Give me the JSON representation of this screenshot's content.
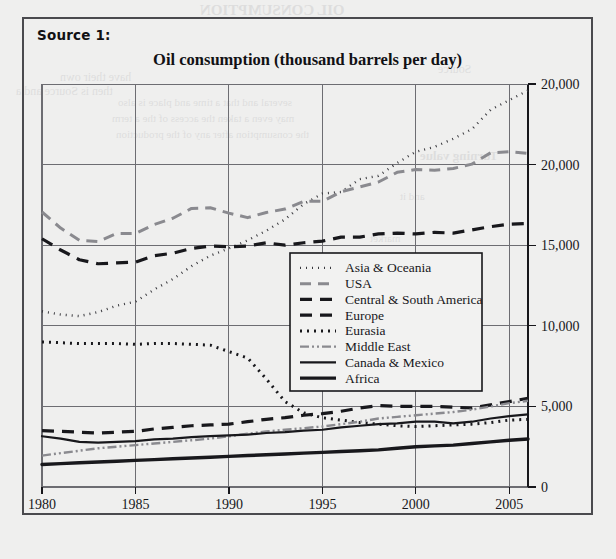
{
  "page": {
    "background_color": "#efefee",
    "frame_color": "#4a4a4e",
    "source_label": "Source 1:"
  },
  "bleed_text": [
    {
      "text": "OIL CONSUMPTION",
      "x": 200,
      "y": 2,
      "size": 15,
      "weight": "bold"
    },
    {
      "text": "have their own",
      "x": 60,
      "y": 70,
      "size": 12,
      "weight": "normal"
    },
    {
      "text": "several and that a time and place is also",
      "x": 118,
      "y": 96,
      "size": 11,
      "weight": "normal"
    },
    {
      "text": "may even a taken the access of the a term",
      "x": 112,
      "y": 112,
      "size": 11,
      "weight": "normal"
    },
    {
      "text": "the consumption after any of the production",
      "x": 116,
      "y": 128,
      "size": 11,
      "weight": "normal"
    },
    {
      "text": "Source",
      "x": 438,
      "y": 62,
      "size": 12,
      "weight": "normal"
    },
    {
      "text": "then is Source and a",
      "x": 16,
      "y": 84,
      "size": 12,
      "weight": "normal"
    },
    {
      "text": "Turning value",
      "x": 420,
      "y": 148,
      "size": 13,
      "weight": "bold"
    },
    {
      "text": "and it",
      "x": 400,
      "y": 190,
      "size": 11,
      "weight": "normal"
    },
    {
      "text": "market",
      "x": 370,
      "y": 232,
      "size": 11,
      "weight": "normal"
    }
  ],
  "chart_data": {
    "type": "line",
    "title": "Oil consumption (thousand barrels per day)",
    "xlabel": "",
    "ylabel": "",
    "grid": true,
    "legend_position": "center",
    "x": [
      1980,
      1981,
      1982,
      1983,
      1984,
      1985,
      1986,
      1987,
      1988,
      1989,
      1990,
      1991,
      1992,
      1993,
      1994,
      1995,
      1996,
      1997,
      1998,
      1999,
      2000,
      2001,
      2002,
      2003,
      2004,
      2005,
      2006
    ],
    "xlim": [
      1980,
      2006
    ],
    "ylim": [
      0,
      25000
    ],
    "xticks": [
      1980,
      1985,
      1990,
      1995,
      2000,
      2005
    ],
    "xtick_labels": [
      "1980",
      "1985",
      "1990",
      "1995",
      "2000",
      "2005"
    ],
    "yticks": [
      0,
      5000,
      10000,
      15000,
      20000,
      25000
    ],
    "ytick_labels": [
      "0",
      "5,000",
      "10,000",
      "15,000",
      "20,000",
      "20,000"
    ],
    "series": [
      {
        "name": "Asia & Oceania",
        "style": "dotted-fine",
        "color": "#3a3a3f",
        "width": 2.4,
        "dash": "1,5",
        "values": [
          10900,
          10700,
          10600,
          10850,
          11250,
          11500,
          12250,
          12900,
          13700,
          14350,
          14800,
          15300,
          15900,
          16600,
          17550,
          18200,
          18300,
          19100,
          19300,
          20100,
          20800,
          21100,
          21600,
          22200,
          23400,
          24000,
          24600
        ]
      },
      {
        "name": "USA",
        "style": "dashed-gray",
        "color": "#8a8a8f",
        "width": 3.0,
        "dash": "11,7",
        "values": [
          17060,
          16060,
          15300,
          15230,
          15730,
          15730,
          16280,
          16670,
          17280,
          17320,
          16990,
          16710,
          17030,
          17240,
          17720,
          17720,
          18310,
          18620,
          18920,
          19520,
          19700,
          19650,
          19760,
          20030,
          20730,
          20800,
          20690
        ]
      },
      {
        "name": "Central & South America",
        "style": "dashed-black-thick",
        "color": "#18181c",
        "width": 3.2,
        "dash": "12,8",
        "values": [
          3500,
          3450,
          3400,
          3350,
          3400,
          3450,
          3600,
          3700,
          3800,
          3850,
          3900,
          4050,
          4200,
          4300,
          4450,
          4550,
          4700,
          4900,
          5050,
          5000,
          5000,
          5000,
          4950,
          4900,
          5100,
          5300,
          5500
        ]
      },
      {
        "name": "Europe",
        "style": "dashed-black",
        "color": "#18181c",
        "width": 3.2,
        "dash": "12,8",
        "values": [
          15400,
          14700,
          14100,
          13850,
          13900,
          13950,
          14350,
          14500,
          14800,
          14950,
          14900,
          14950,
          15150,
          15000,
          15150,
          15250,
          15500,
          15500,
          15700,
          15750,
          15700,
          15800,
          15750,
          15950,
          16150,
          16300,
          16350
        ]
      },
      {
        "name": "Eurasia",
        "style": "dotted-bold",
        "color": "#18181c",
        "width": 3.0,
        "dash": "2,5",
        "values": [
          9000,
          8950,
          8900,
          8900,
          8900,
          8850,
          8900,
          8900,
          8850,
          8800,
          8400,
          8000,
          6700,
          5300,
          4600,
          4300,
          4150,
          4000,
          3900,
          3800,
          3750,
          3800,
          3850,
          3900,
          4000,
          4150,
          4200
        ]
      },
      {
        "name": "Middle East",
        "style": "dash-dot-dot-gray",
        "color": "#8a8a8f",
        "width": 2.4,
        "dash": "9,3,2,3,2,3",
        "values": [
          1950,
          2100,
          2250,
          2400,
          2500,
          2600,
          2700,
          2800,
          2900,
          3000,
          3150,
          3300,
          3450,
          3550,
          3650,
          3750,
          3900,
          4050,
          4250,
          4350,
          4450,
          4550,
          4650,
          4800,
          5000,
          5200,
          5350
        ]
      },
      {
        "name": "Canada & Mexico",
        "style": "solid-thin",
        "color": "#18181c",
        "width": 2.2,
        "dash": "none",
        "values": [
          3150,
          3000,
          2800,
          2750,
          2800,
          2850,
          2950,
          3000,
          3100,
          3150,
          3200,
          3250,
          3350,
          3400,
          3500,
          3550,
          3700,
          3800,
          3900,
          3950,
          4050,
          4050,
          3950,
          4050,
          4250,
          4400,
          4500
        ]
      },
      {
        "name": "Africa",
        "style": "solid-thick",
        "color": "#18181c",
        "width": 3.4,
        "dash": "none",
        "values": [
          1400,
          1450,
          1500,
          1550,
          1600,
          1650,
          1700,
          1750,
          1800,
          1850,
          1900,
          1950,
          2000,
          2050,
          2100,
          2150,
          2200,
          2250,
          2300,
          2400,
          2500,
          2550,
          2600,
          2700,
          2800,
          2900,
          2980
        ]
      }
    ]
  },
  "plot_geometry": {
    "left": 42,
    "right": 528,
    "top": 84,
    "bottom": 487
  },
  "legend_box": {
    "x": 290,
    "y": 253,
    "width": 192,
    "height": 138
  }
}
